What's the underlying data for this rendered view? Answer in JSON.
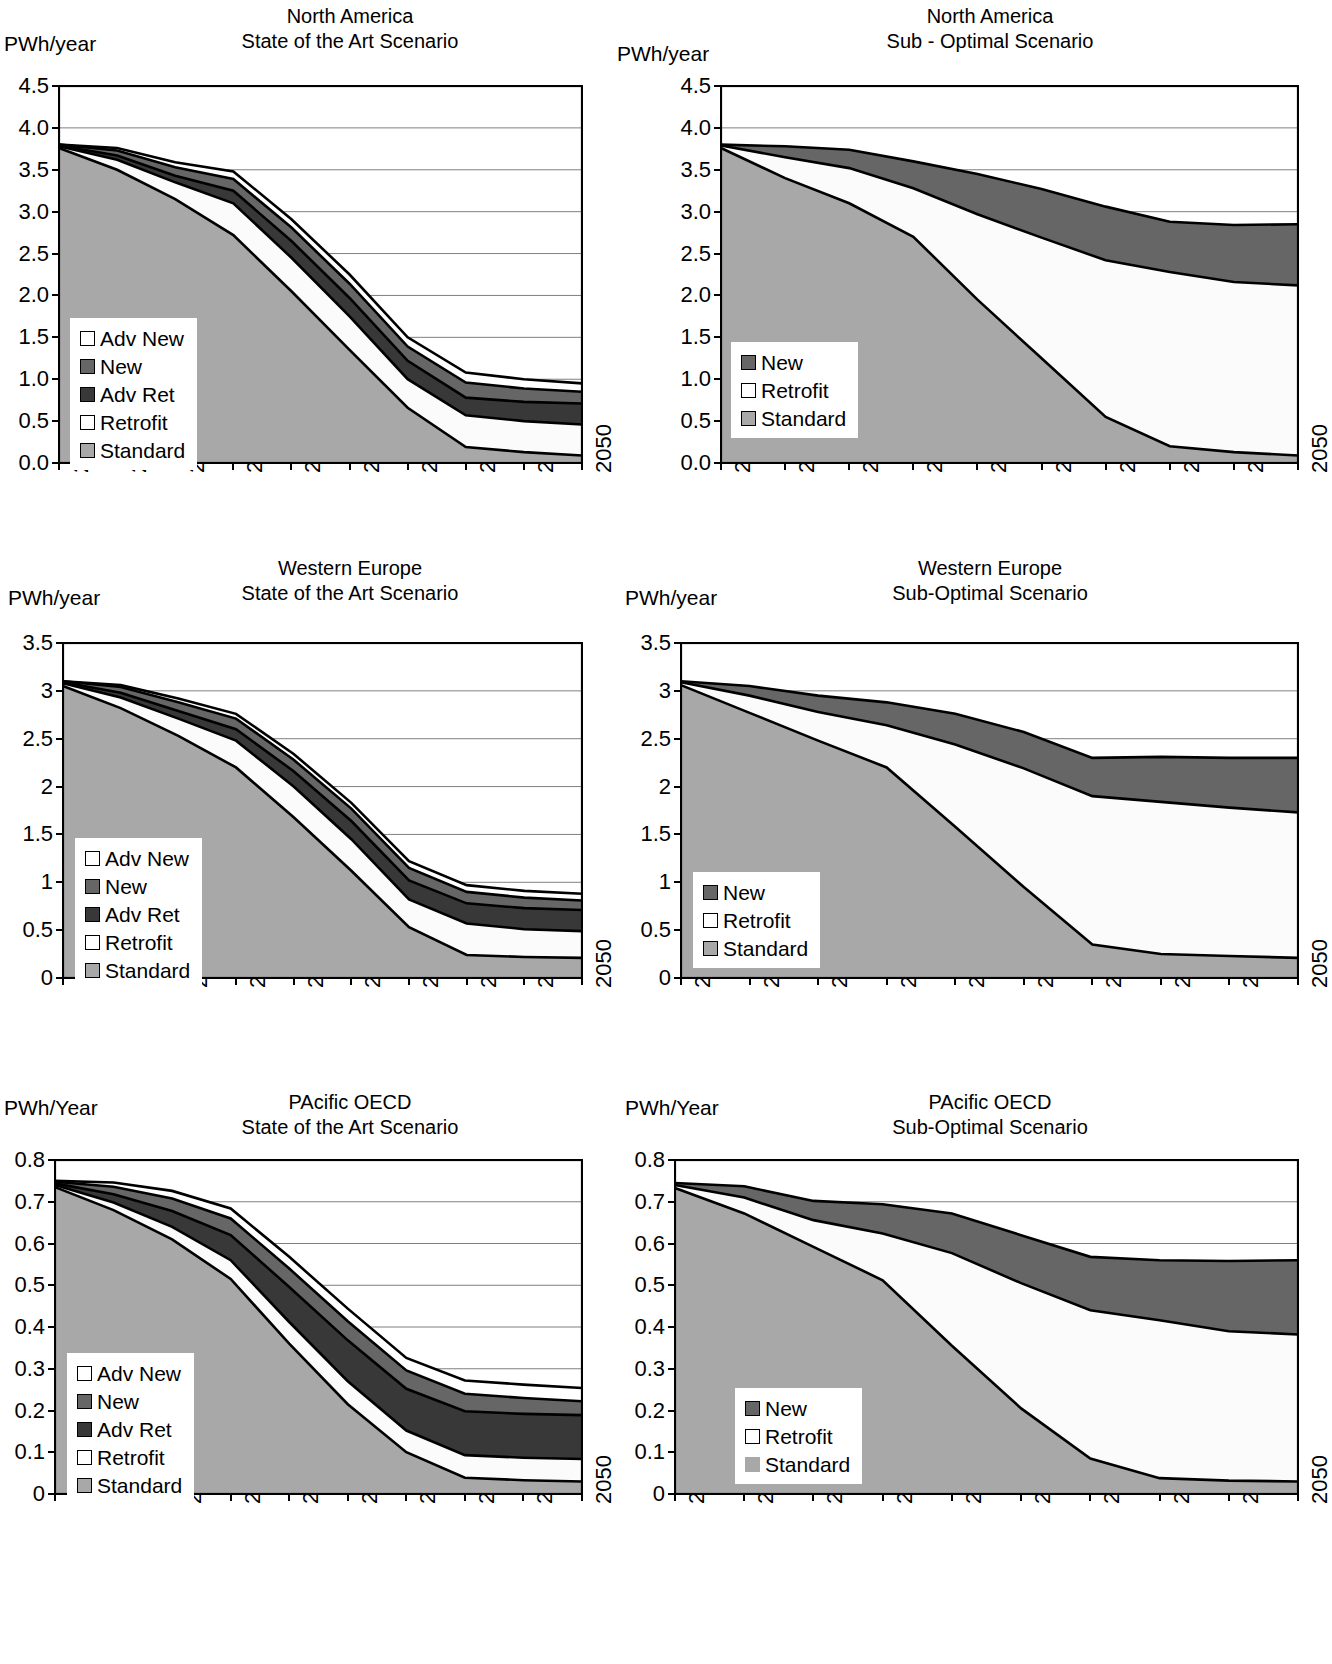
{
  "palette": {
    "standard": "#a8a8a8",
    "retrofit": "#fbfbfb",
    "adv_ret": "#383838",
    "new": "#666666",
    "adv_new": "#ffffff",
    "axis": "#000000",
    "gridline": "#808080",
    "background": "#ffffff"
  },
  "charts": [
    {
      "id": "north-america-state-of-the-art",
      "unit_label": "PWh/year",
      "title_line1": "North America",
      "title_line2": "State of the Art Scenario",
      "legend": [
        {
          "label": "Adv New",
          "color": "#ffffff",
          "bordered": true
        },
        {
          "label": "New",
          "color": "#666666",
          "bordered": true
        },
        {
          "label": "Adv Ret",
          "color": "#383838",
          "bordered": true
        },
        {
          "label": "Retrofit",
          "color": "#ffffff",
          "bordered": true
        },
        {
          "label": "Standard",
          "color": "#a8a8a8",
          "bordered": true
        }
      ],
      "chart_data": {
        "type": "area",
        "title": "North America — State of the Art Scenario",
        "xlabel": "",
        "ylabel": "PWh/year",
        "ylim": [
          0.0,
          4.5
        ],
        "yticks": [
          "0.0",
          "0.5",
          "1.0",
          "1.5",
          "2.0",
          "2.5",
          "3.0",
          "3.5",
          "4.0",
          "4.5"
        ],
        "x": [
          2005,
          2010,
          2015,
          2020,
          2025,
          2030,
          2035,
          2040,
          2045,
          2050
        ],
        "xtick_labels": [
          "2005",
          "2010",
          "2015",
          "2020",
          "2025",
          "2030",
          "2035",
          "2040",
          "2045",
          "2050"
        ],
        "grid": true,
        "legend_position": "inside-left",
        "stacked": true,
        "series": [
          {
            "name": "Standard",
            "values": [
              3.76,
              3.5,
              3.15,
              2.72,
              2.05,
              1.35,
              0.66,
              0.19,
              0.13,
              0.09
            ]
          },
          {
            "name": "Retrofit",
            "values": [
              0.02,
              0.12,
              0.2,
              0.38,
              0.4,
              0.4,
              0.34,
              0.38,
              0.37,
              0.37
            ]
          },
          {
            "name": "Adv Ret",
            "values": [
              0.01,
              0.05,
              0.08,
              0.15,
              0.2,
              0.22,
              0.22,
              0.21,
              0.23,
              0.25
            ]
          },
          {
            "name": "New",
            "values": [
              0.01,
              0.06,
              0.1,
              0.14,
              0.16,
              0.17,
              0.17,
              0.18,
              0.16,
              0.14
            ]
          },
          {
            "name": "Adv New",
            "values": [
              0.0,
              0.03,
              0.06,
              0.09,
              0.1,
              0.11,
              0.11,
              0.12,
              0.11,
              0.1
            ]
          }
        ]
      }
    },
    {
      "id": "north-america-sub-optimal",
      "unit_label": "PWh/year",
      "title_line1": "North America",
      "title_line2": "Sub - Optimal Scenario",
      "legend": [
        {
          "label": "New",
          "color": "#666666",
          "bordered": true
        },
        {
          "label": "Retrofit",
          "color": "#ffffff",
          "bordered": true
        },
        {
          "label": "Standard",
          "color": "#a8a8a8",
          "bordered": true
        }
      ],
      "chart_data": {
        "type": "area",
        "title": "North America — Sub - Optimal Scenario",
        "xlabel": "",
        "ylabel": "PWh/year",
        "ylim": [
          0.0,
          4.5
        ],
        "yticks": [
          "0.0",
          "0.5",
          "1.0",
          "1.5",
          "2.0",
          "2.5",
          "3.0",
          "3.5",
          "4.0",
          "4.5"
        ],
        "x": [
          2005,
          2010,
          2015,
          2020,
          2025,
          2030,
          2035,
          2040,
          2045,
          2050
        ],
        "xtick_labels": [
          "2005",
          "2010",
          "2015",
          "2020",
          "2025",
          "2030",
          "2035",
          "2040",
          "2045",
          "2050"
        ],
        "grid": true,
        "legend_position": "inside-left",
        "stacked": true,
        "series": [
          {
            "name": "Standard",
            "values": [
              3.76,
              3.4,
              3.1,
              2.7,
              1.95,
              1.25,
              0.55,
              0.2,
              0.13,
              0.09
            ]
          },
          {
            "name": "Retrofit",
            "values": [
              0.03,
              0.25,
              0.42,
              0.58,
              1.02,
              1.44,
              1.87,
              2.08,
              2.03,
              2.03
            ]
          },
          {
            "name": "New",
            "values": [
              0.01,
              0.13,
              0.22,
              0.32,
              0.48,
              0.58,
              0.64,
              0.6,
              0.68,
              0.73
            ]
          }
        ]
      }
    },
    {
      "id": "western-europe-state-of-the-art",
      "unit_label": "PWh/year",
      "title_line1": "Western Europe",
      "title_line2": "State of the Art Scenario",
      "legend": [
        {
          "label": "Adv New",
          "color": "#ffffff",
          "bordered": true
        },
        {
          "label": "New",
          "color": "#666666",
          "bordered": true
        },
        {
          "label": "Adv Ret",
          "color": "#383838",
          "bordered": true
        },
        {
          "label": "Retrofit",
          "color": "#ffffff",
          "bordered": true
        },
        {
          "label": "Standard",
          "color": "#a8a8a8",
          "bordered": true
        }
      ],
      "chart_data": {
        "type": "area",
        "title": "Western Europe — State of the Art Scenario",
        "xlabel": "",
        "ylabel": "PWh/year",
        "ylim": [
          0,
          3.5
        ],
        "yticks": [
          "0",
          "0.5",
          "1",
          "1.5",
          "2",
          "2.5",
          "3",
          "3.5"
        ],
        "x": [
          2005,
          2010,
          2015,
          2020,
          2025,
          2030,
          2035,
          2040,
          2045,
          2050
        ],
        "xtick_labels": [
          "2005",
          "2010",
          "2015",
          "2020",
          "2025",
          "2030",
          "2035",
          "2040",
          "2045",
          "2050"
        ],
        "grid": true,
        "legend_position": "inside-left",
        "stacked": true,
        "series": [
          {
            "name": "Standard",
            "values": [
              3.05,
              2.82,
              2.53,
              2.2,
              1.68,
              1.12,
              0.53,
              0.24,
              0.22,
              0.21
            ]
          },
          {
            "name": "Retrofit",
            "values": [
              0.03,
              0.11,
              0.18,
              0.28,
              0.32,
              0.33,
              0.29,
              0.33,
              0.29,
              0.28
            ]
          },
          {
            "name": "Adv Ret",
            "values": [
              0.01,
              0.05,
              0.08,
              0.12,
              0.16,
              0.19,
              0.2,
              0.21,
              0.22,
              0.22
            ]
          },
          {
            "name": "New",
            "values": [
              0.01,
              0.06,
              0.09,
              0.11,
              0.12,
              0.13,
              0.13,
              0.12,
              0.11,
              0.1
            ]
          },
          {
            "name": "Adv New",
            "values": [
              0.0,
              0.02,
              0.04,
              0.05,
              0.06,
              0.06,
              0.07,
              0.07,
              0.07,
              0.07
            ]
          }
        ]
      }
    },
    {
      "id": "western-europe-sub-optimal",
      "unit_label": "PWh/year",
      "title_line1": "Western Europe",
      "title_line2": "Sub-Optimal Scenario",
      "legend": [
        {
          "label": "New",
          "color": "#666666",
          "bordered": true
        },
        {
          "label": "Retrofit",
          "color": "#ffffff",
          "bordered": true
        },
        {
          "label": "Standard",
          "color": "#a8a8a8",
          "bordered": true
        }
      ],
      "chart_data": {
        "type": "area",
        "title": "Western Europe — Sub-Optimal Scenario",
        "xlabel": "",
        "ylabel": "PWh/year",
        "ylim": [
          0,
          3.5
        ],
        "yticks": [
          "0",
          "0.5",
          "1",
          "1.5",
          "2",
          "2.5",
          "3",
          "3.5"
        ],
        "x": [
          2005,
          2010,
          2015,
          2020,
          2025,
          2030,
          2035,
          2040,
          2045,
          2050
        ],
        "xtick_labels": [
          "2005",
          "2010",
          "2015",
          "2020",
          "2025",
          "2030",
          "2035",
          "2040",
          "2045",
          "2050"
        ],
        "grid": true,
        "legend_position": "inside-left",
        "stacked": true,
        "series": [
          {
            "name": "Standard",
            "values": [
              3.06,
              2.77,
              2.48,
              2.2,
              1.58,
              0.95,
              0.35,
              0.25,
              0.23,
              0.21
            ]
          },
          {
            "name": "Retrofit",
            "values": [
              0.03,
              0.18,
              0.3,
              0.44,
              0.86,
              1.24,
              1.55,
              1.59,
              1.55,
              1.52
            ]
          },
          {
            "name": "New",
            "values": [
              0.01,
              0.1,
              0.17,
              0.24,
              0.32,
              0.38,
              0.4,
              0.47,
              0.52,
              0.57
            ]
          }
        ]
      }
    },
    {
      "id": "pacific-oecd-state-of-the-art",
      "unit_label": "PWh/Year",
      "title_line1": "PAcific OECD",
      "title_line2": "State of the Art Scenario",
      "legend": [
        {
          "label": "Adv New",
          "color": "#ffffff",
          "bordered": true
        },
        {
          "label": "New",
          "color": "#666666",
          "bordered": true
        },
        {
          "label": "Adv Ret",
          "color": "#383838",
          "bordered": true
        },
        {
          "label": "Retrofit",
          "color": "#ffffff",
          "bordered": true
        },
        {
          "label": "Standard",
          "color": "#a8a8a8",
          "bordered": true
        }
      ],
      "chart_data": {
        "type": "area",
        "title": "PAcific OECD — State of the Art Scenario",
        "xlabel": "",
        "ylabel": "PWh/Year",
        "ylim": [
          0,
          0.8
        ],
        "yticks": [
          "0",
          "0.1",
          "0.2",
          "0.3",
          "0.4",
          "0.5",
          "0.6",
          "0.7",
          "0.8"
        ],
        "x": [
          2005,
          2010,
          2015,
          2020,
          2025,
          2030,
          2035,
          2040,
          2045,
          2050
        ],
        "xtick_labels": [
          "2005",
          "2010",
          "2015",
          "2020",
          "2025",
          "2030",
          "2035",
          "2040",
          "2045",
          "2050"
        ],
        "grid": true,
        "legend_position": "inside-left",
        "stacked": true,
        "series": [
          {
            "name": "Standard",
            "values": [
              0.735,
              0.68,
              0.61,
              0.515,
              0.36,
              0.215,
              0.1,
              0.039,
              0.033,
              0.03
            ]
          },
          {
            "name": "Retrofit",
            "values": [
              0.005,
              0.018,
              0.03,
              0.045,
              0.052,
              0.055,
              0.052,
              0.054,
              0.054,
              0.054
            ]
          },
          {
            "name": "Adv Ret",
            "values": [
              0.004,
              0.02,
              0.038,
              0.06,
              0.084,
              0.098,
              0.1,
              0.105,
              0.105,
              0.105
            ]
          },
          {
            "name": "New",
            "values": [
              0.004,
              0.018,
              0.03,
              0.04,
              0.044,
              0.046,
              0.044,
              0.042,
              0.038,
              0.033
            ]
          },
          {
            "name": "Adv New",
            "values": [
              0.002,
              0.01,
              0.018,
              0.024,
              0.028,
              0.03,
              0.03,
              0.032,
              0.032,
              0.032
            ]
          }
        ]
      }
    },
    {
      "id": "pacific-oecd-sub-optimal",
      "unit_label": "PWh/Year",
      "title_line1": "PAcific OECD",
      "title_line2": "Sub-Optimal Scenario",
      "legend": [
        {
          "label": "New",
          "color": "#666666",
          "bordered": true
        },
        {
          "label": "Retrofit",
          "color": "#ffffff",
          "bordered": true
        },
        {
          "label": "Standard",
          "color": "#a8a8a8",
          "bordered": false
        }
      ],
      "chart_data": {
        "type": "area",
        "title": "PAcific OECD — Sub-Optimal Scenario",
        "xlabel": "",
        "ylabel": "PWh/Year",
        "ylim": [
          0,
          0.8
        ],
        "yticks": [
          "0",
          "0.1",
          "0.2",
          "0.3",
          "0.4",
          "0.5",
          "0.6",
          "0.7",
          "0.8"
        ],
        "x": [
          2005,
          2010,
          2015,
          2020,
          2025,
          2030,
          2035,
          2040,
          2045,
          2050
        ],
        "xtick_labels": [
          "2005",
          "2010",
          "2015",
          "2020",
          "2025",
          "2030",
          "2035",
          "2040",
          "2045",
          "2050"
        ],
        "grid": true,
        "legend_position": "inside-left",
        "stacked": true,
        "series": [
          {
            "name": "Standard",
            "values": [
              0.733,
              0.672,
              0.592,
              0.512,
              0.355,
              0.205,
              0.085,
              0.038,
              0.032,
              0.03
            ]
          },
          {
            "name": "Retrofit",
            "values": [
              0.007,
              0.038,
              0.064,
              0.112,
              0.222,
              0.3,
              0.355,
              0.378,
              0.358,
              0.352
            ]
          },
          {
            "name": "New",
            "values": [
              0.005,
              0.027,
              0.046,
              0.07,
              0.095,
              0.115,
              0.128,
              0.144,
              0.168,
              0.178
            ]
          }
        ]
      }
    }
  ]
}
